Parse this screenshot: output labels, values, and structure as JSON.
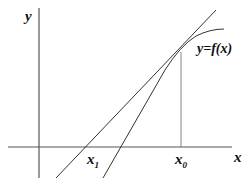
{
  "diagram": {
    "type": "newton-method-tangent",
    "axes": {
      "x_label": "x",
      "y_label": "y"
    },
    "curve_label": "y=f(x)",
    "points": {
      "x0_label": "x",
      "x0_sub": "0",
      "x1_label": "x",
      "x1_sub": "1"
    },
    "colors": {
      "axis": "#555555",
      "line": "#333333",
      "text": "#111111"
    }
  }
}
